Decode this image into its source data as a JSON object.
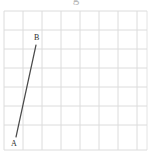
{
  "figure": {
    "name": "line-segment-on-grid",
    "background_color": "#ffffff",
    "width": 152,
    "height": 156,
    "clipped_text_above": "g"
  },
  "grid": {
    "line_color": "#dcdcdc",
    "line_color_major": "#d2d2d2",
    "stroke_width": 1,
    "cell_size": 19,
    "left": 4,
    "top": 11,
    "right": 147,
    "bottom": 150,
    "columns": 8,
    "rows": 7,
    "x_lines": [
      4,
      23,
      42,
      61,
      80,
      99,
      118,
      137,
      147
    ],
    "y_lines": [
      11,
      30,
      49,
      68,
      87,
      106,
      125,
      150
    ]
  },
  "segment": {
    "label": "AB",
    "color": "#4a4a4a",
    "stroke_width": 1.2,
    "start_point": "A",
    "end_point": "B",
    "x1": 16,
    "y1": 137,
    "x2": 36,
    "y2": 45
  },
  "labels": {
    "a": "A",
    "b": "B",
    "color": "#2b2b2b"
  },
  "chart_data": {
    "type": "scatter",
    "title": "",
    "xlabel": "",
    "ylabel": "",
    "grid": true,
    "legend": "none",
    "xlim": [
      0,
      8
    ],
    "ylim": [
      0,
      7
    ],
    "points": [
      {
        "name": "A",
        "x": 0.63,
        "y": 0.68
      },
      {
        "name": "B",
        "x": 1.68,
        "y": 5.53
      }
    ],
    "series": [
      {
        "name": "segment AB",
        "type": "line",
        "x": [
          0.63,
          1.68
        ],
        "y": [
          0.68,
          5.53
        ]
      }
    ],
    "annotations": [
      {
        "text": "A",
        "x": 0.63,
        "y": 0.68,
        "position": "below-left"
      },
      {
        "text": "B",
        "x": 1.68,
        "y": 5.53,
        "position": "above-right"
      }
    ]
  }
}
